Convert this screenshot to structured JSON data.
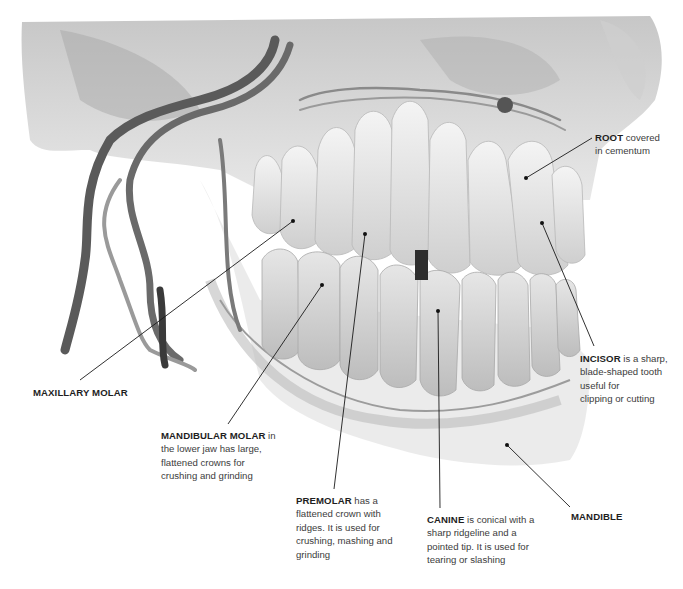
{
  "figure": {
    "background": "#ffffff",
    "tone": "grayscale"
  },
  "labels": [
    {
      "id": "root",
      "title": "ROOT",
      "text": " covered",
      "lines": [
        "in cementum"
      ],
      "anchor": [
        526,
        178
      ],
      "label_at": [
        592,
        138
      ]
    },
    {
      "id": "incisor",
      "title": "INCISOR",
      "text": " is a sharp,",
      "lines": [
        "blade-shaped tooth",
        "useful for",
        "clipping or cutting"
      ],
      "anchor": [
        542,
        223
      ],
      "label_at": [
        594,
        346
      ]
    },
    {
      "id": "maxillary-molar",
      "title": "MAXILLARY MOLAR",
      "text": "",
      "lines": [],
      "anchor": [
        293,
        221
      ],
      "label_at": [
        80,
        380
      ]
    },
    {
      "id": "mandibular-molar",
      "title": "MANDIBULAR MOLAR",
      "text": " in",
      "lines": [
        "the lower jaw has large,",
        "flattened crowns for",
        "crushing and grinding"
      ],
      "anchor": [
        322,
        285
      ],
      "label_at": [
        228,
        424
      ]
    },
    {
      "id": "premolar",
      "title": "PREMOLAR",
      "text": " has a",
      "lines": [
        "flattened crown with",
        "ridges. It is used for",
        "crushing, mashing and",
        "grinding"
      ],
      "anchor": [
        365,
        234
      ],
      "label_at": [
        334,
        489
      ]
    },
    {
      "id": "canine",
      "title": "CANINE",
      "text": " is conical with a",
      "lines": [
        "sharp ridgeline and a",
        "pointed tip. It is used for",
        "tearing or slashing"
      ],
      "anchor": [
        438,
        311
      ],
      "label_at": [
        440,
        508
      ]
    },
    {
      "id": "mandible",
      "title": "MANDIBLE",
      "text": "",
      "lines": [],
      "anchor": [
        507,
        445
      ],
      "label_at": [
        570,
        507
      ]
    }
  ]
}
